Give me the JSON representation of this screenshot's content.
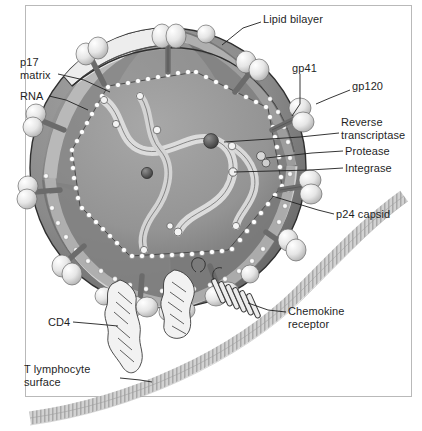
{
  "figure": {
    "type": "labeled biological diagram",
    "frame_color": "#b9b9b9",
    "background": "#ffffff"
  },
  "palette": {
    "envelope_mid": "#8a8a8a",
    "envelope_dark": "#6e6e6e",
    "envelope_darkest": "#5a5a5a",
    "matrix_light": "#efefef",
    "core_fill": "#9a9a9a",
    "core_dark": "#7d7d7d",
    "rna_ribbon": "#dcdcdc",
    "spike_knob": "#e8e8e8",
    "spike_stalk": "#6b6b6b",
    "capsid_bead": "#ffffff",
    "cell_membrane": "#c9c9c9",
    "line": "#1f1f1f",
    "text": "#1f1f1f"
  },
  "labels": [
    {
      "id": "lipid-bilayer",
      "text": "Lipid bilayer",
      "lines": [
        "Lipid bilayer"
      ],
      "x": 263,
      "y": 13,
      "anchor": "left",
      "leader": [
        [
          261,
          22
        ],
        [
          243,
          28
        ],
        [
          222,
          45
        ]
      ]
    },
    {
      "id": "gp41",
      "text": "gp41",
      "lines": [
        "gp41"
      ],
      "x": 292,
      "y": 62,
      "anchor": "left",
      "leader": [
        [
          300,
          74
        ],
        [
          300,
          104
        ],
        [
          292,
          116
        ]
      ]
    },
    {
      "id": "gp120",
      "text": "gp120",
      "lines": [
        "gp120"
      ],
      "x": 352,
      "y": 80,
      "anchor": "left",
      "leader": [
        [
          350,
          90
        ],
        [
          330,
          98
        ],
        [
          316,
          104
        ]
      ]
    },
    {
      "id": "p17-matrix",
      "text": "p17 matrix",
      "lines": [
        "p17",
        "matrix"
      ],
      "x": 20,
      "y": 56,
      "anchor": "left",
      "leader": [
        [
          58,
          74
        ],
        [
          84,
          80
        ],
        [
          110,
          92
        ]
      ]
    },
    {
      "id": "rna",
      "text": "RNA",
      "lines": [
        "RNA"
      ],
      "x": 20,
      "y": 90,
      "anchor": "left",
      "leader": [
        [
          49,
          96
        ],
        [
          66,
          100
        ],
        [
          88,
          110
        ]
      ]
    },
    {
      "id": "reverse-transcriptase",
      "text": "Reverse transcriptase",
      "lines": [
        "Reverse",
        "transcriptase"
      ],
      "x": 341,
      "y": 116,
      "anchor": "left",
      "leader": [
        [
          339,
          133
        ],
        [
          300,
          137
        ],
        [
          224,
          142
        ]
      ]
    },
    {
      "id": "protease",
      "text": "Protease",
      "lines": [
        "Protease"
      ],
      "x": 345,
      "y": 145,
      "anchor": "left",
      "leader": [
        [
          343,
          151
        ],
        [
          312,
          153
        ],
        [
          266,
          158
        ]
      ]
    },
    {
      "id": "integrase",
      "text": "Integrase",
      "lines": [
        "Integrase"
      ],
      "x": 345,
      "y": 162,
      "anchor": "left",
      "leader": [
        [
          343,
          168
        ],
        [
          310,
          170
        ],
        [
          234,
          172
        ]
      ]
    },
    {
      "id": "p24-capsid",
      "text": "p24 capsid",
      "lines": [
        "p24 capsid"
      ],
      "x": 336,
      "y": 208,
      "anchor": "left",
      "leader": [
        [
          334,
          214
        ],
        [
          318,
          210
        ],
        [
          272,
          196
        ]
      ]
    },
    {
      "id": "chemokine-receptor",
      "text": "Chemokine receptor",
      "lines": [
        "Chemokine",
        "receptor"
      ],
      "x": 288,
      "y": 305,
      "anchor": "left",
      "leader": [
        [
          286,
          312
        ],
        [
          268,
          310
        ],
        [
          248,
          303
        ]
      ]
    },
    {
      "id": "cd4",
      "text": "CD4",
      "lines": [
        "CD4"
      ],
      "x": 48,
      "y": 316,
      "anchor": "left",
      "leader": [
        [
          73,
          322
        ],
        [
          96,
          324
        ],
        [
          118,
          326
        ]
      ]
    },
    {
      "id": "t-lymphocyte-surface",
      "text": "T lymphocyte surface",
      "lines": [
        "T lymphocyte",
        "surface"
      ],
      "x": 24,
      "y": 363,
      "anchor": "left",
      "leader": [
        [
          120,
          378
        ],
        [
          140,
          380
        ],
        [
          152,
          382
        ]
      ]
    }
  ],
  "structures": [
    {
      "name": "virion-envelope",
      "desc": "spherical HIV envelope, cutaway at top"
    },
    {
      "name": "lipid-bilayer-cut",
      "desc": "cut edge of lipid bilayer membrane"
    },
    {
      "name": "gp120-knob",
      "desc": "surface glycoprotein knob",
      "count": 22
    },
    {
      "name": "gp41-stalk",
      "desc": "transmembrane stalk",
      "count": 12
    },
    {
      "name": "p17-matrix-layer",
      "desc": "light matrix shell beneath envelope"
    },
    {
      "name": "p24-capsid",
      "desc": "beaded polygonal capsid shell outline"
    },
    {
      "name": "rna-strand",
      "desc": "viral RNA ribbon with nucleocapsid beads",
      "count": 2
    },
    {
      "name": "reverse-transcriptase-sphere",
      "desc": "dark enzyme sphere"
    },
    {
      "name": "protease-sphere",
      "desc": "small paired enzyme sphere"
    },
    {
      "name": "integrase-sphere",
      "desc": "small enzyme sphere"
    },
    {
      "name": "cd4-receptor",
      "desc": "elongated multi-domain CD4 molecule",
      "count": 2
    },
    {
      "name": "chemokine-receptor",
      "desc": "seven-helix transmembrane bundle"
    },
    {
      "name": "t-cell-membrane",
      "desc": "striped host cell membrane band"
    }
  ]
}
